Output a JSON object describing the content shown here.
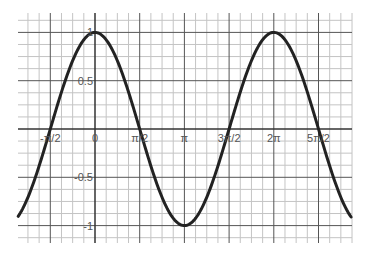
{
  "chart_data": {
    "type": "line",
    "title": "",
    "xlabel": "",
    "ylabel": "",
    "function": "y = cos(x)",
    "xlim": [
      -2.7,
      9.0
    ],
    "ylim": [
      -1.2,
      1.2
    ],
    "grid": true,
    "legend": null,
    "x_ticks": [
      {
        "value": -1.5708,
        "label": "-π/2"
      },
      {
        "value": 0,
        "label": "0"
      },
      {
        "value": 1.5708,
        "label": "π/2"
      },
      {
        "value": 3.1416,
        "label": "π"
      },
      {
        "value": 4.7124,
        "label": "3π/2"
      },
      {
        "value": 6.2832,
        "label": "2π"
      },
      {
        "value": 7.854,
        "label": "5π/2"
      }
    ],
    "y_ticks": [
      {
        "value": 1,
        "label": "1"
      },
      {
        "value": 0.5,
        "label": "0.5"
      },
      {
        "value": -0.5,
        "label": "-0.5"
      },
      {
        "value": -1,
        "label": "-1"
      }
    ],
    "series": [
      {
        "name": "cos(x)",
        "color": "#222222",
        "x": [
          -2.7,
          -1.5708,
          0,
          1.5708,
          3.1416,
          4.7124,
          6.2832,
          7.854,
          9.0
        ],
        "values": [
          -0.904,
          0,
          1,
          0,
          -1,
          0,
          1,
          0,
          -0.911
        ]
      }
    ]
  },
  "colors": {
    "background": "#ffffff",
    "major_grid": "#555555",
    "minor_grid": "#c4c4c4",
    "axis": "#333333",
    "curve": "#222222",
    "label": "#555555"
  }
}
